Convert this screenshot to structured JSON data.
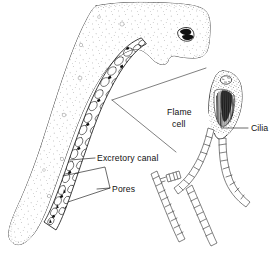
{
  "figure": {
    "background_color": "#ffffff",
    "ink_color": "#111111"
  },
  "labels": {
    "flame_cell_line1": "Flame",
    "flame_cell_line2": "cell",
    "cilia": "Cilia",
    "excretory_canal": "Excretory  canal",
    "pores": "Pores"
  },
  "structures": {
    "body": "worm-body-outline",
    "eyespot": "eyespot",
    "canal_band": "excretory-canal-band",
    "flame_cell_detail": "flame-cell-magnified",
    "tubules": "excretory-tubule-cell-chains",
    "magnifier_cone": "magnification-cone-lines"
  }
}
